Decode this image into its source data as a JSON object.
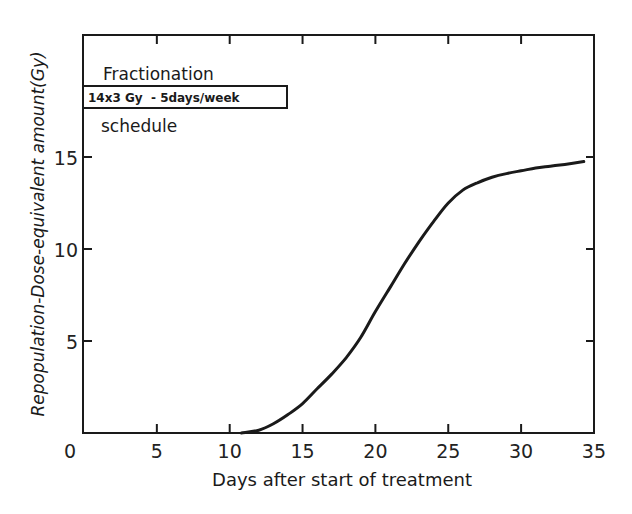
{
  "chart_data": {
    "type": "line",
    "title": "",
    "xlabel": "Days after start of treatment",
    "ylabel": "Repopulation-Dose-equivalent amount(Gy)",
    "xlim": [
      0,
      35
    ],
    "ylim": [
      0,
      22
    ],
    "x_ticks": [
      0,
      5,
      10,
      15,
      20,
      25,
      30,
      35
    ],
    "x_tick_labels": [
      "0",
      "5",
      "10",
      "15",
      "20",
      "25",
      "30",
      "35"
    ],
    "y_ticks": [
      5,
      10,
      15
    ],
    "y_tick_labels": [
      "5",
      "10",
      "15"
    ],
    "grid": false,
    "legend": null,
    "annotations": {
      "line1": "Fractionation",
      "boxed": "14x3 Gy  - 5days/week",
      "line3": "schedule"
    },
    "series": [
      {
        "name": "Repopulation dose-equivalent",
        "x": [
          10.8,
          12,
          13,
          14,
          15,
          16,
          17,
          18,
          19,
          20,
          21,
          22,
          23,
          24,
          25,
          26,
          27,
          28,
          29,
          30,
          31,
          32,
          33,
          34.3
        ],
        "y": [
          0,
          0.15,
          0.5,
          1.0,
          1.6,
          2.4,
          3.2,
          4.1,
          5.2,
          6.6,
          7.9,
          9.2,
          10.4,
          11.5,
          12.5,
          13.2,
          13.6,
          13.9,
          14.1,
          14.25,
          14.4,
          14.5,
          14.6,
          14.75
        ]
      }
    ]
  },
  "colors": {
    "ink": "#1a1a1a",
    "background": "#ffffff"
  }
}
